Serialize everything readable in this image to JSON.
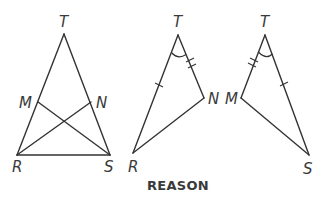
{
  "figure": {
    "caption": "REASON",
    "colors": {
      "stroke": "#333333",
      "label": "#3a3a3a",
      "background": "#ffffff"
    },
    "triangles": [
      {
        "name": "triangle-RST-with-cevians",
        "vertices": {
          "T": {
            "label": "T",
            "x": 64,
            "y": 34
          },
          "M": {
            "label": "M",
            "x": 38,
            "y": 102
          },
          "N": {
            "label": "N",
            "x": 91,
            "y": 102
          },
          "R": {
            "label": "R",
            "x": 17,
            "y": 155
          },
          "S": {
            "label": "S",
            "x": 110,
            "y": 155
          }
        },
        "segments": [
          "TR",
          "TS",
          "RS",
          "RN",
          "SM"
        ]
      },
      {
        "name": "triangle-TRN",
        "vertices": {
          "T": {
            "label": "T",
            "x": 178,
            "y": 35
          },
          "N": {
            "label": "N",
            "x": 204,
            "y": 98
          },
          "R": {
            "label": "R",
            "x": 133,
            "y": 153
          }
        },
        "marks": {
          "TR": "single-tick",
          "TN": "double-tick",
          "angle_T": "arc"
        }
      },
      {
        "name": "triangle-TMS",
        "vertices": {
          "T": {
            "label": "T",
            "x": 265,
            "y": 35
          },
          "M": {
            "label": "M",
            "x": 241,
            "y": 98
          },
          "S": {
            "label": "S",
            "x": 309,
            "y": 155
          }
        },
        "marks": {
          "TM": "double-tick",
          "TS": "single-tick",
          "angle_T": "arc"
        }
      }
    ]
  }
}
